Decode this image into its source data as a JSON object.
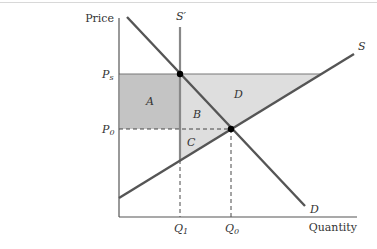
{
  "diagram": {
    "type": "supply-demand-price-support",
    "axes": {
      "y_label": "Price",
      "x_label": "Quantity"
    },
    "price_levels": [
      {
        "id": "Ps",
        "label": "P",
        "subscript": "s"
      },
      {
        "id": "P0",
        "label": "P",
        "subscript": "0"
      }
    ],
    "quantity_levels": [
      {
        "id": "Q1",
        "label": "Q",
        "subscript": "1"
      },
      {
        "id": "Q0",
        "label": "Q",
        "subscript": "0"
      }
    ],
    "curves": [
      {
        "id": "S",
        "label": "S",
        "kind": "supply"
      },
      {
        "id": "S_prime",
        "label": "S′",
        "kind": "restricted-supply (vertical)"
      },
      {
        "id": "D",
        "label": "D",
        "kind": "demand"
      }
    ],
    "regions": [
      {
        "id": "A",
        "label": "A",
        "shade": "dark"
      },
      {
        "id": "B",
        "label": "B",
        "shade": "light"
      },
      {
        "id": "C",
        "label": "C",
        "shade": "light"
      },
      {
        "id": "D_area",
        "label": "D",
        "shade": "light"
      }
    ],
    "colors": {
      "curve": "#555555",
      "restricted_supply": "#888888",
      "dark_shade": "#c4c4c4",
      "light_shade": "#dedede",
      "axis": "#555555",
      "point": "#000000"
    }
  }
}
